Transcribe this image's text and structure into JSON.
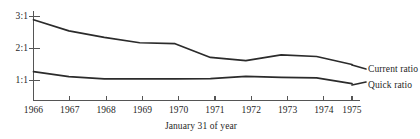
{
  "chart_data": {
    "type": "line",
    "title": "",
    "subtitle": "",
    "xlabel": "January 31 of year",
    "ylabel": "",
    "x": [
      1966,
      1967,
      1968,
      1969,
      1970,
      1971,
      1972,
      1973,
      1974,
      1975
    ],
    "categories": [
      "1966",
      "1967",
      "1968",
      "1969",
      "1970",
      "1971",
      "1972",
      "1973",
      "1974",
      "1975"
    ],
    "xlim": [
      1966,
      1975
    ],
    "ylim": [
      0,
      3.0
    ],
    "yticks": [
      1,
      2,
      3
    ],
    "ytick_labels": [
      "1:1",
      "2:1",
      "3:1"
    ],
    "grid": false,
    "legend_position": "right-inline-labels",
    "series": [
      {
        "name": "Current ratio",
        "values": [
          2.9,
          2.55,
          2.35,
          2.18,
          2.15,
          1.72,
          1.62,
          1.8,
          1.75,
          1.5
        ]
      },
      {
        "name": "Quick ratio",
        "values": [
          1.28,
          1.12,
          1.05,
          1.05,
          1.05,
          1.06,
          1.13,
          1.1,
          1.08,
          0.9
        ]
      }
    ]
  },
  "axis": {
    "y_ticks": [
      {
        "label": "3:1",
        "value": 3
      },
      {
        "label": "2:1",
        "value": 2
      },
      {
        "label": "1:1",
        "value": 1
      }
    ],
    "x_ticks": [
      {
        "label": "1966",
        "value": 1966
      },
      {
        "label": "1967",
        "value": 1967
      },
      {
        "label": "1968",
        "value": 1968
      },
      {
        "label": "1969",
        "value": 1969
      },
      {
        "label": "1970",
        "value": 1970
      },
      {
        "label": "1971",
        "value": 1971
      },
      {
        "label": "1972",
        "value": 1972
      },
      {
        "label": "1973",
        "value": 1973
      },
      {
        "label": "1974",
        "value": 1974
      },
      {
        "label": "1975",
        "value": 1975
      }
    ],
    "x_axis_title": "January 31 of year"
  },
  "series_labels": [
    {
      "name": "Current ratio"
    },
    {
      "name": "Quick ratio"
    }
  ],
  "colors": {
    "line": "#2b2b2b",
    "axis": "#555555",
    "text": "#1f1f1f",
    "background": "#ffffff"
  }
}
